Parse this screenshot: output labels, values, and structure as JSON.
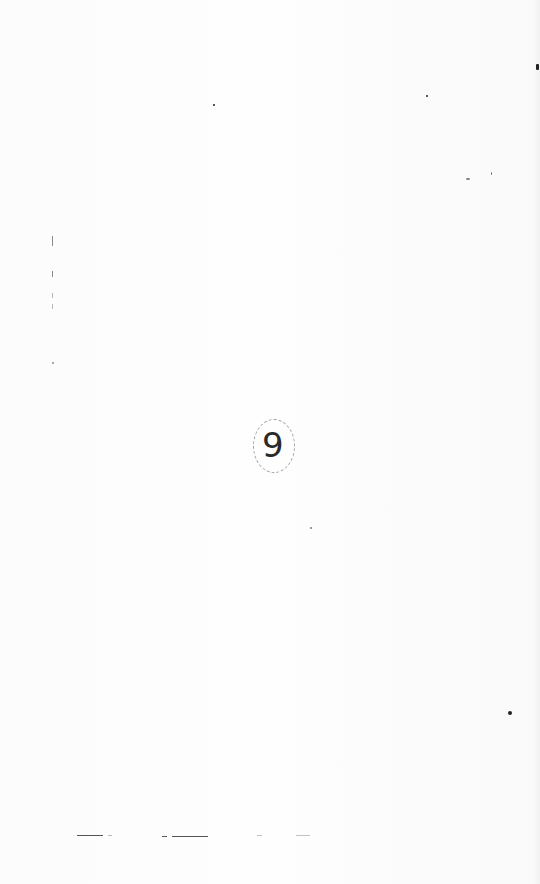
{
  "page": {
    "background": "#fdfdfd",
    "page_number_mark": "9",
    "ink_color": "#2a2a2a"
  }
}
